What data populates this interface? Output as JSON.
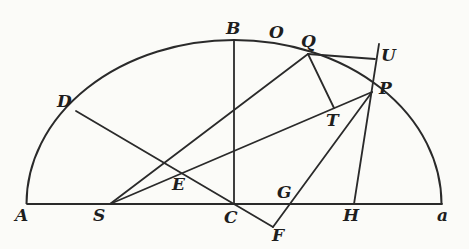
{
  "diagram": {
    "type": "geometric-figure",
    "colors": {
      "ink": "#2a2a2a",
      "paper": "#fbfbf8"
    },
    "ellipse": {
      "cx": 234,
      "cy": 204,
      "rx": 207.5,
      "ry": 164
    },
    "points": {
      "A": [
        27,
        204
      ],
      "S": [
        110,
        204
      ],
      "C": [
        234,
        204
      ],
      "G": [
        280,
        204
      ],
      "H": [
        354,
        204
      ],
      "a": [
        442,
        204
      ],
      "B": [
        234,
        40
      ],
      "Q": [
        308,
        54
      ],
      "U": [
        375,
        59
      ],
      "Ut": [
        379,
        44
      ],
      "P": [
        372,
        92
      ],
      "D": [
        76,
        111
      ],
      "E": [
        182,
        174
      ],
      "T": [
        334,
        108
      ],
      "F": [
        273,
        227
      ]
    },
    "segments": [
      [
        "A",
        "a"
      ],
      [
        "C",
        "B"
      ],
      [
        "D",
        "F"
      ],
      [
        "F",
        "P"
      ],
      [
        "S",
        "P"
      ],
      [
        "S",
        "Q"
      ],
      [
        "Q",
        "U"
      ],
      [
        "Ut",
        "H"
      ],
      [
        "Q",
        "T"
      ]
    ],
    "labels": [
      {
        "text": "A",
        "x": 15,
        "y": 207
      },
      {
        "text": "S",
        "x": 93,
        "y": 207
      },
      {
        "text": "C",
        "x": 224,
        "y": 209
      },
      {
        "text": "F",
        "x": 272,
        "y": 227
      },
      {
        "text": "G",
        "x": 277,
        "y": 184
      },
      {
        "text": "H",
        "x": 343,
        "y": 207
      },
      {
        "text": "a",
        "x": 437,
        "y": 207
      },
      {
        "text": "E",
        "x": 172,
        "y": 176
      },
      {
        "text": "D",
        "x": 57,
        "y": 93
      },
      {
        "text": "B",
        "x": 226,
        "y": 20
      },
      {
        "text": "O",
        "x": 269,
        "y": 24
      },
      {
        "text": "Q",
        "x": 301,
        "y": 33
      },
      {
        "text": "U",
        "x": 381,
        "y": 47
      },
      {
        "text": "P",
        "x": 379,
        "y": 80
      },
      {
        "text": "T",
        "x": 326,
        "y": 112
      }
    ]
  }
}
